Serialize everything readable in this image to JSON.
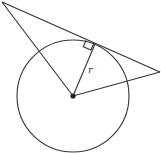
{
  "diagram": {
    "labels": {
      "radius": "r"
    },
    "elements": {
      "circle": "circle",
      "center": "center-point",
      "radius": "radius-segment",
      "tangent": "tangent-line",
      "right_angle": "right-angle-marker",
      "secant_left": "line-center-to-left-vertex",
      "secant_right": "line-center-to-right-vertex"
    },
    "stroke_color": "#333333",
    "background": "#ffffff"
  }
}
